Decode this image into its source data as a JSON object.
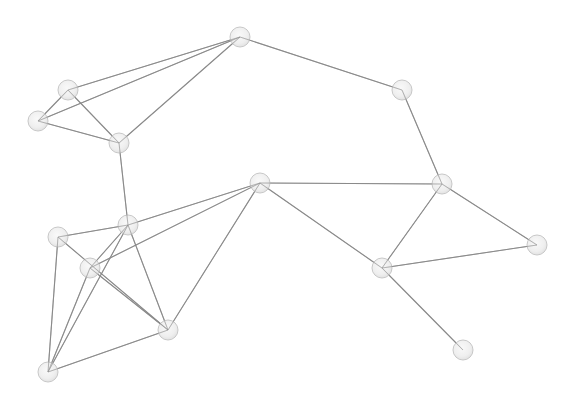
{
  "diagram": {
    "type": "network-graph",
    "colors": {
      "background": "#ffffff",
      "edge": "#8a8a8a",
      "node_fill": "#ededed",
      "node_stroke": "#c8c8c8"
    },
    "node_radius": 10,
    "nodes": [
      {
        "id": 0,
        "x": 240,
        "y": 37
      },
      {
        "id": 1,
        "x": 68,
        "y": 90
      },
      {
        "id": 2,
        "x": 38,
        "y": 121
      },
      {
        "id": 3,
        "x": 119,
        "y": 143
      },
      {
        "id": 4,
        "x": 402,
        "y": 90
      },
      {
        "id": 5,
        "x": 128,
        "y": 225
      },
      {
        "id": 6,
        "x": 58,
        "y": 237
      },
      {
        "id": 7,
        "x": 90,
        "y": 268
      },
      {
        "id": 8,
        "x": 168,
        "y": 330
      },
      {
        "id": 9,
        "x": 48,
        "y": 372
      },
      {
        "id": 10,
        "x": 260,
        "y": 183
      },
      {
        "id": 11,
        "x": 442,
        "y": 184
      },
      {
        "id": 12,
        "x": 382,
        "y": 268
      },
      {
        "id": 13,
        "x": 537,
        "y": 245
      },
      {
        "id": 14,
        "x": 463,
        "y": 350
      }
    ],
    "edges": [
      [
        0,
        1
      ],
      [
        0,
        2
      ],
      [
        0,
        3
      ],
      [
        0,
        4
      ],
      [
        1,
        2
      ],
      [
        1,
        3
      ],
      [
        2,
        3
      ],
      [
        3,
        5
      ],
      [
        4,
        11
      ],
      [
        10,
        11
      ],
      [
        10,
        12
      ],
      [
        11,
        12
      ],
      [
        11,
        13
      ],
      [
        12,
        13
      ],
      [
        12,
        14
      ],
      [
        10,
        5
      ],
      [
        10,
        7
      ],
      [
        10,
        8
      ],
      [
        5,
        6
      ],
      [
        5,
        7
      ],
      [
        5,
        9
      ],
      [
        5,
        8
      ],
      [
        6,
        8
      ],
      [
        6,
        9
      ],
      [
        7,
        8
      ],
      [
        7,
        9
      ],
      [
        8,
        9
      ]
    ]
  }
}
